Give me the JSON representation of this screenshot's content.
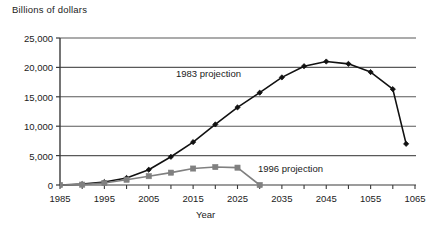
{
  "chart_data": {
    "type": "line",
    "title": "",
    "ylabel": "Billions of dollars",
    "xlabel": "Year",
    "grid": "horizontal",
    "legend_position": "inline-annotations",
    "xlim": [
      1985,
      1065
    ],
    "ylim": [
      0,
      25000
    ],
    "x_tick_labels": [
      "1985",
      "1995",
      "2005",
      "2015",
      "2025",
      "2035",
      "2045",
      "1055",
      "1065"
    ],
    "x_tick_values": [
      1985,
      1995,
      2005,
      2015,
      2025,
      2035,
      2045,
      2055,
      2065
    ],
    "x_minor_tick_values": [
      1990,
      2000,
      2010,
      2020,
      2030,
      2040,
      2050,
      2060
    ],
    "y_tick_labels": [
      "0",
      "5,000",
      "10,000",
      "15,000",
      "20,000",
      "25,000"
    ],
    "y_tick_values": [
      0,
      5000,
      10000,
      15000,
      20000,
      25000
    ],
    "series": [
      {
        "name": "1983 projection",
        "color": "#111111",
        "marker": "diamond",
        "x": [
          1985,
          1990,
          1995,
          2000,
          2005,
          2010,
          2015,
          2020,
          2025,
          2030,
          2035,
          2040,
          2045,
          2050,
          2055,
          2060,
          2063
        ],
        "values": [
          0,
          150,
          500,
          1200,
          2600,
          4800,
          7300,
          10300,
          13200,
          15700,
          18300,
          20200,
          21000,
          20600,
          19200,
          16300,
          7000
        ]
      },
      {
        "name": "1996 projection",
        "color": "#808080",
        "marker": "square",
        "x": [
          1985,
          1990,
          1995,
          2000,
          2005,
          2010,
          2015,
          2020,
          2025,
          2030
        ],
        "values": [
          0,
          60,
          350,
          900,
          1500,
          2100,
          2800,
          3050,
          2950,
          0
        ]
      }
    ],
    "annotations": [
      {
        "text": "1983 projection",
        "x_px": 176,
        "y_px": 68
      },
      {
        "text": "1996 projection",
        "x_px": 258,
        "y_px": 163
      }
    ]
  },
  "axis": {
    "y_title": "Billions of dollars",
    "x_title": "Year"
  }
}
